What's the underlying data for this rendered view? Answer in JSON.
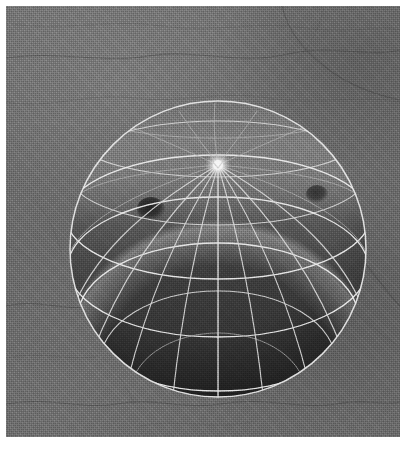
{
  "image": {
    "kind": "3d-viewport-render",
    "width": 418,
    "height": 457,
    "border_color": "#ffffff",
    "border_width_px": 6,
    "color_mode": "grayscale"
  },
  "viewport": {
    "label": "",
    "background_color": "#6e6e6e",
    "shading_mode": "solid-shaded-with-wireframe",
    "light_direction": "above"
  },
  "ground": {
    "name": "ground-plane",
    "base_color": "#6e6e6e",
    "highlight_color": "#7d7d7d",
    "shadow_color": "#5a5a5a",
    "crack_color": "#3f3f3f",
    "texture": "noisy dithered stone with crack veins"
  },
  "object": {
    "name": "uv-sphere",
    "type": "sphere",
    "meridians": 16,
    "parallels": 10,
    "wireframe_color": "#d8d8d8",
    "silhouette_color": "#e8e8e8",
    "surface_light_color": "#767676",
    "surface_dark_color": "#3a3a3a",
    "center_x": 212,
    "center_y": 243,
    "radius_x": 148,
    "radius_y": 148,
    "bounds": {
      "left": 65,
      "top": 95,
      "right": 360,
      "bottom": 388
    }
  },
  "highlights": [
    {
      "name": "pole-specular-highlight",
      "cx": 213,
      "cy": 158,
      "radius": 10,
      "color": "#f2f2f2"
    }
  ],
  "spots": [
    {
      "name": "surface-spot-left",
      "cx": 145,
      "cy": 203,
      "radius_x": 13,
      "radius_y": 11,
      "color": "#242424"
    },
    {
      "name": "surface-spot-right",
      "cx": 311,
      "cy": 188,
      "radius_x": 10,
      "radius_y": 8,
      "color": "#3c3c3c"
    },
    {
      "name": "surface-spot-top-right",
      "cx": 294,
      "cy": 102,
      "radius_x": 12,
      "radius_y": 7,
      "color": "#3a3a3a"
    }
  ]
}
